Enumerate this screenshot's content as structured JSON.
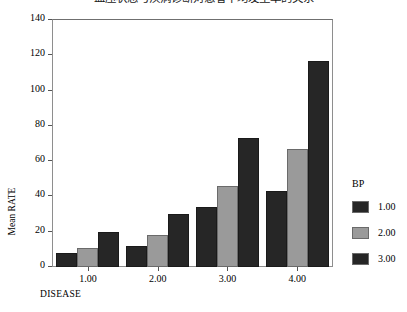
{
  "chart_data": {
    "type": "bar",
    "title": "血压状态与疾病诊断对患者平均发生率的关系",
    "xlabel": "DISEASE",
    "ylabel": "Mean RATE",
    "categories": [
      "1.00",
      "2.00",
      "3.00",
      "4.00"
    ],
    "series": [
      {
        "name": "1.00",
        "values": [
          8,
          12,
          34,
          43
        ],
        "color": "#262626"
      },
      {
        "name": "2.00",
        "values": [
          11,
          18,
          46,
          67
        ],
        "color": "#9a9a9a"
      },
      {
        "name": "3.00",
        "values": [
          20,
          30,
          73,
          117
        ],
        "color": "#262626"
      }
    ],
    "ylim": [
      0,
      140
    ],
    "yticks": [
      0,
      20,
      40,
      60,
      80,
      100,
      120,
      140
    ],
    "ytick_labels": [
      "0",
      "20",
      "40",
      "60",
      "80",
      "100",
      "120",
      "140"
    ],
    "grid": false,
    "legend": {
      "title": "BP",
      "position": "right",
      "entries": [
        "1.00",
        "2.00",
        "3.00"
      ]
    }
  }
}
